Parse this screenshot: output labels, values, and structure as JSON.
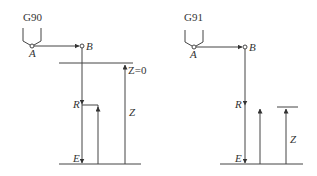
{
  "diagrams": [
    {
      "id": "g90",
      "mode_label": "G90",
      "point_a": "A",
      "point_b": "B",
      "level_r": "R",
      "level_e": "E",
      "z_zero_label": "Z=0",
      "z_label": "Z"
    },
    {
      "id": "g91",
      "mode_label": "G91",
      "point_a": "A",
      "point_b": "B",
      "level_r": "R",
      "level_e": "E",
      "z_label": "Z"
    }
  ],
  "colors": {
    "line": "#444444",
    "text": "#333333",
    "background": "#ffffff"
  }
}
